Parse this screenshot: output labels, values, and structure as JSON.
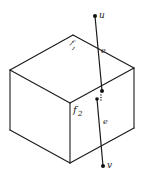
{
  "diagram": {
    "labels": {
      "u": "u",
      "v": "v",
      "e_upper": "e",
      "e_lower": "e",
      "f1": "f",
      "f1_sub": "1",
      "f2": "f",
      "f2_sub": "2"
    },
    "colors": {
      "stroke": "#1a1a1a",
      "background": "#ffffff"
    }
  }
}
